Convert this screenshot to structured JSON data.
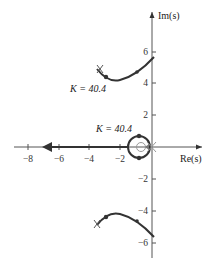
{
  "diagram": {
    "type": "root-locus",
    "axes": {
      "x_label": "Re(s)",
      "y_label": "Im(s)",
      "x_ticks": [
        "−8",
        "−6",
        "−4",
        "−2"
      ],
      "y_ticks_pos": [
        "6",
        "4",
        "2"
      ],
      "y_ticks_neg": [
        "−2",
        "−4",
        "−6"
      ]
    },
    "annotations": {
      "gain_upper": "K = 40.4",
      "gain_real": "K = 40.4"
    },
    "colors": {
      "locus": "#333333",
      "axis": "#555555",
      "marker_light": "#999999"
    }
  }
}
